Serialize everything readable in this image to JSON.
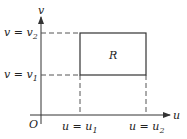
{
  "diagram": {
    "axes": {
      "x_label": "u",
      "y_label": "v",
      "origin_label": "O"
    },
    "region_label": "R",
    "v_levels": [
      {
        "id": "v2",
        "text": "v = v",
        "sub": "2"
      },
      {
        "id": "v1",
        "text": "v = v",
        "sub": "1"
      }
    ],
    "u_levels": [
      {
        "id": "u1",
        "text": "u = u",
        "sub": "1"
      },
      {
        "id": "u2",
        "text": "u = u",
        "sub": "2"
      }
    ],
    "colors": {
      "line": "#333333",
      "dash": "#555555"
    }
  }
}
